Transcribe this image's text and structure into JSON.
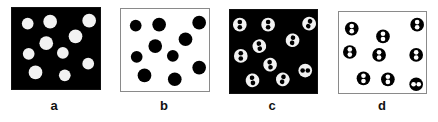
{
  "figure": {
    "panels": [
      {
        "label": "a",
        "background": "#000000",
        "particle_color": "#f2f2f2",
        "particle_style": "solid",
        "box": {
          "x": 11,
          "y": 7,
          "w": 90,
          "h": 83
        },
        "label_pos": {
          "x": 44,
          "y": 98
        },
        "particles": [
          [
            16,
            16,
            6
          ],
          [
            39,
            14,
            7
          ],
          [
            79,
            13,
            7
          ],
          [
            65,
            29,
            7
          ],
          [
            35,
            36,
            7
          ],
          [
            17,
            47,
            6
          ],
          [
            52,
            46,
            6
          ],
          [
            78,
            57,
            6
          ],
          [
            24,
            66,
            7
          ],
          [
            54,
            69,
            6
          ]
        ]
      },
      {
        "label": "b",
        "background": "#ffffff",
        "particle_color": "#000000",
        "particle_style": "solid",
        "box": {
          "x": 120,
          "y": 8,
          "w": 90,
          "h": 84
        },
        "label_pos": {
          "x": 154,
          "y": 98
        },
        "particles": [
          [
            15,
            17,
            6
          ],
          [
            39,
            16,
            7
          ],
          [
            80,
            14,
            7
          ],
          [
            66,
            31,
            7
          ],
          [
            35,
            38,
            7
          ],
          [
            16,
            49,
            6
          ],
          [
            53,
            48,
            6
          ],
          [
            80,
            60,
            7
          ],
          [
            24,
            68,
            7
          ],
          [
            55,
            72,
            7
          ]
        ]
      },
      {
        "label": "c",
        "background": "#000000",
        "particle_color": "#f2f2f2",
        "particle_style": "dipole-dark-dots",
        "box": {
          "x": 229,
          "y": 9,
          "w": 89,
          "h": 85
        },
        "label_pos": {
          "x": 262,
          "y": 98
        },
        "particles": [
          [
            10,
            15,
            7,
            0
          ],
          [
            39,
            15,
            7,
            0
          ],
          [
            81,
            14,
            7,
            20
          ],
          [
            64,
            31,
            7,
            10
          ],
          [
            30,
            37,
            7,
            -10
          ],
          [
            11,
            47,
            7,
            0
          ],
          [
            41,
            56,
            7,
            -10
          ],
          [
            77,
            62,
            7,
            90
          ],
          [
            23,
            72,
            7,
            -10
          ],
          [
            54,
            71,
            7,
            15
          ]
        ]
      },
      {
        "label": "d",
        "background": "#ffffff",
        "particle_color": "#000000",
        "particle_style": "dipole-light-dots",
        "box": {
          "x": 338,
          "y": 11,
          "w": 89,
          "h": 83
        },
        "label_pos": {
          "x": 372,
          "y": 98
        },
        "particles": [
          [
            13,
            17,
            7,
            0
          ],
          [
            45,
            25,
            7,
            0
          ],
          [
            80,
            13,
            7,
            0
          ],
          [
            11,
            41,
            7,
            0
          ],
          [
            41,
            44,
            7,
            0
          ],
          [
            79,
            44,
            7,
            0
          ],
          [
            25,
            68,
            7,
            0
          ],
          [
            50,
            69,
            7,
            0
          ],
          [
            79,
            74,
            7,
            90
          ]
        ]
      }
    ]
  }
}
